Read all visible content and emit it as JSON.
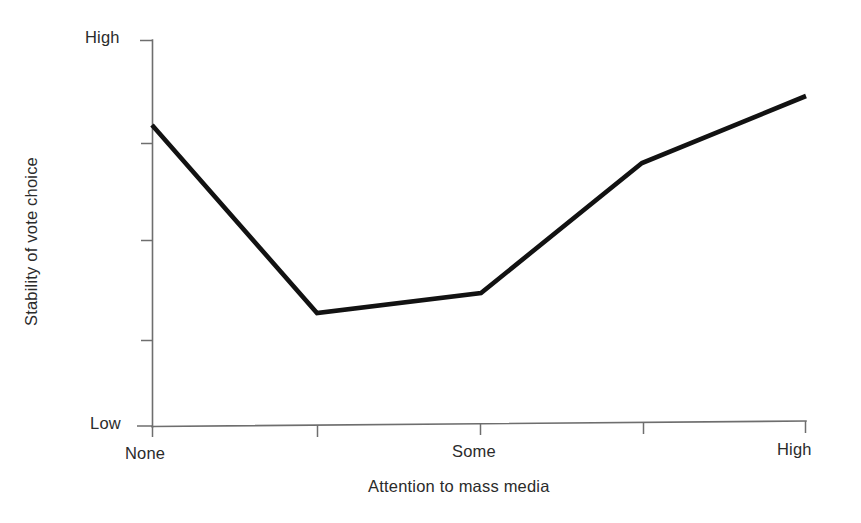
{
  "figure": {
    "background_color": "#ffffff",
    "line_color": "#121212",
    "axis_color": "#6e6e6e",
    "text_color": "#2b2b2b"
  },
  "axes": {
    "y_axis_title": "Stability of vote choice",
    "x_axis_title": "Attention to mass media",
    "y_tick_labels": [
      "High",
      "Low"
    ],
    "x_tick_labels": [
      "None",
      "Some",
      "High"
    ]
  },
  "labels": {
    "y_high": "High",
    "y_low": "Low",
    "x_none": "None",
    "x_some": "Some",
    "x_high": "High"
  },
  "chart_data": {
    "type": "line",
    "title": "",
    "subtitle": "",
    "xlabel": "Attention to mass media",
    "ylabel": "Stability of vote choice",
    "x_tick_labels": [
      "None",
      "",
      "Some",
      "",
      "High"
    ],
    "y_tick_labels": [
      "Low",
      "",
      "",
      "",
      "High"
    ],
    "xlim": [
      "None",
      "High"
    ],
    "ylim": [
      "Low",
      "High"
    ],
    "grid": false,
    "legend": false,
    "legend_position": "none",
    "annotations": [],
    "categories": [
      "None",
      "Low-moderate",
      "Some",
      "Moderate-high",
      "High"
    ],
    "x": [
      0,
      1,
      2,
      3,
      4
    ],
    "values": [
      0.79,
      0.29,
      0.34,
      0.68,
      0.86
    ],
    "series": [
      {
        "name": "Stability of vote choice",
        "values": [
          0.79,
          0.29,
          0.34,
          0.68,
          0.86
        ]
      }
    ],
    "pixel_points": [
      [
        152,
        125
      ],
      [
        317,
        313
      ],
      [
        481,
        293
      ],
      [
        642,
        163
      ],
      [
        806,
        96
      ]
    ]
  },
  "geometry": {
    "y_axis_x": 152,
    "y_axis_top": 40,
    "y_axis_bottom": 426,
    "x_axis_left": 152,
    "x_axis_right": 806,
    "y_tick_positions": [
      40,
      143,
      240,
      340,
      425
    ],
    "x_tick_positions": [
      152,
      317,
      480,
      643,
      806
    ]
  }
}
